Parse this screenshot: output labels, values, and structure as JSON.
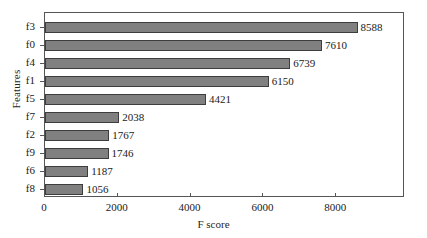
{
  "chart_data": {
    "type": "bar",
    "orientation": "horizontal",
    "title": "",
    "xlabel": "F score",
    "ylabel": "Features",
    "categories": [
      "f3",
      "f0",
      "f4",
      "f1",
      "f5",
      "f7",
      "f2",
      "f9",
      "f6",
      "f8"
    ],
    "values": [
      8588,
      7610,
      6739,
      6150,
      4421,
      2038,
      1767,
      1746,
      1187,
      1056
    ],
    "value_labels": [
      "8588",
      "7610",
      "6739",
      "6150",
      "4421",
      "2038",
      "1767",
      "1746",
      "1187",
      "1056"
    ],
    "xlim": [
      0,
      9890
    ],
    "xticks": [
      0,
      2000,
      4000,
      6000,
      8000
    ],
    "xtick_labels": [
      "0",
      "2000",
      "4000",
      "6000",
      "8000"
    ],
    "grid": false,
    "legend": "none",
    "bar_color": "#808080",
    "bar_edge_color": "#3d3d3d",
    "axis_color": "#555555",
    "text_color": "#1a1a1a"
  }
}
